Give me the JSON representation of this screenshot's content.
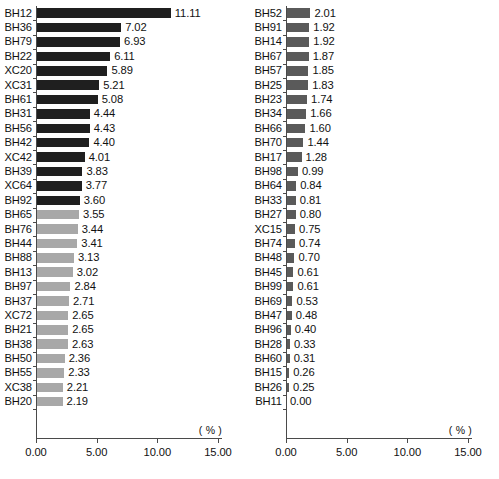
{
  "chart_data": {
    "type": "bar",
    "orientation": "horizontal",
    "title": "",
    "xlabel": "( % )",
    "ylabel": "",
    "xlim": [
      0.0,
      15.0
    ],
    "xticks": [
      "0.00",
      "5.00",
      "10.00",
      "15.00"
    ],
    "xtick_values": [
      0.0,
      5.0,
      10.0,
      15.0
    ],
    "grid": false,
    "legend": null,
    "unit_label": "( % )",
    "panels": [
      {
        "name": "left-panel",
        "categories": [
          "BH12",
          "BH36",
          "BH79",
          "BH22",
          "XC20",
          "XC31",
          "BH61",
          "BH31",
          "BH56",
          "BH42",
          "XC42",
          "BH39",
          "XC64",
          "BH92",
          "BH65",
          "BH76",
          "BH44",
          "BH88",
          "BH13",
          "BH97",
          "BH37",
          "XC72",
          "BH21",
          "BH38",
          "BH50",
          "BH55",
          "XC38",
          "BH20"
        ],
        "values": [
          11.11,
          7.02,
          6.93,
          6.11,
          5.89,
          5.21,
          5.08,
          4.44,
          4.43,
          4.4,
          4.01,
          3.83,
          3.77,
          3.6,
          3.55,
          3.44,
          3.41,
          3.13,
          3.02,
          2.84,
          2.71,
          2.65,
          2.65,
          2.63,
          2.36,
          2.33,
          2.21,
          2.19
        ],
        "labels": [
          "11.11",
          "7.02",
          "6.93",
          "6.11",
          "5.89",
          "5.21",
          "5.08",
          "4.44",
          "4.43",
          "4.40",
          "4.01",
          "3.83",
          "3.77",
          "3.60",
          "3.55",
          "3.44",
          "3.41",
          "3.13",
          "3.02",
          "2.84",
          "2.71",
          "2.65",
          "2.65",
          "2.63",
          "2.36",
          "2.33",
          "2.21",
          "2.19"
        ],
        "shades": [
          "dark",
          "dark",
          "dark",
          "dark",
          "dark",
          "dark",
          "dark",
          "dark",
          "dark",
          "dark",
          "dark",
          "dark",
          "dark",
          "dark",
          "light",
          "light",
          "light",
          "light",
          "light",
          "light",
          "light",
          "light",
          "light",
          "light",
          "light",
          "light",
          "light",
          "light"
        ]
      },
      {
        "name": "right-panel",
        "categories": [
          "BH52",
          "BH91",
          "BH14",
          "BH67",
          "BH57",
          "BH25",
          "BH23",
          "BH34",
          "BH66",
          "BH70",
          "BH17",
          "BH98",
          "BH64",
          "BH33",
          "BH27",
          "XC15",
          "BH74",
          "BH48",
          "BH45",
          "BH99",
          "BH69",
          "BH47",
          "BH96",
          "BH28",
          "BH60",
          "BH15",
          "BH26",
          "BH11"
        ],
        "values": [
          2.01,
          1.92,
          1.92,
          1.87,
          1.85,
          1.83,
          1.74,
          1.66,
          1.6,
          1.44,
          1.28,
          0.99,
          0.84,
          0.81,
          0.8,
          0.75,
          0.74,
          0.7,
          0.61,
          0.61,
          0.53,
          0.48,
          0.4,
          0.33,
          0.31,
          0.26,
          0.25,
          0.0
        ],
        "labels": [
          "2.01",
          "1.92",
          "1.92",
          "1.87",
          "1.85",
          "1.83",
          "1.74",
          "1.66",
          "1.60",
          "1.44",
          "1.28",
          "0.99",
          "0.84",
          "0.81",
          "0.80",
          "0.75",
          "0.74",
          "0.70",
          "0.61",
          "0.61",
          "0.53",
          "0.48",
          "0.40",
          "0.33",
          "0.31",
          "0.26",
          "0.25",
          "0.00"
        ],
        "shades": [
          "mid",
          "mid",
          "mid",
          "mid",
          "mid",
          "mid",
          "mid",
          "mid",
          "mid",
          "mid",
          "mid",
          "mid",
          "mid",
          "mid",
          "mid",
          "mid",
          "mid",
          "mid",
          "mid",
          "mid",
          "mid",
          "mid",
          "mid",
          "mid",
          "mid",
          "mid",
          "mid",
          "mid"
        ]
      }
    ],
    "colors": {
      "dark": "#1f1f1f",
      "mid": "#5a5a5a",
      "light": "#a8a8a8",
      "axis": "#4a4a4a",
      "background": "#ffffff"
    }
  },
  "caption": ""
}
